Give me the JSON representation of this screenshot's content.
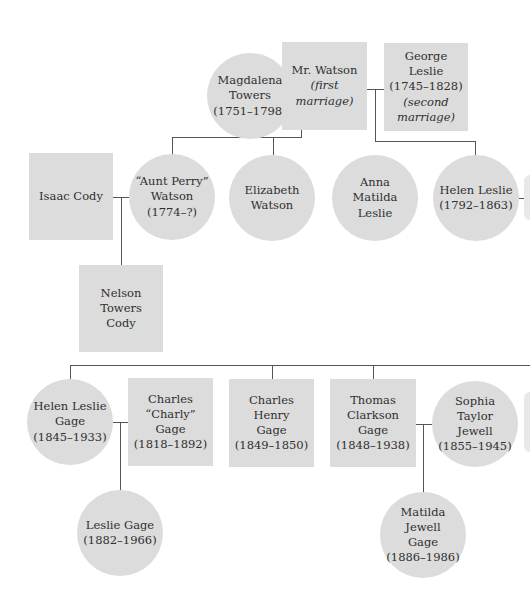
{
  "diagram": {
    "type": "family-tree",
    "colors": {
      "node_fill": "#dcdcdc",
      "text": "#2f2f2f",
      "line": "#555555"
    },
    "nodes": {
      "magdalena": {
        "shape": "circle",
        "name": "Magdalena Towers",
        "line1": "Magdalena",
        "line2": "Towers",
        "dates": "(1751–1798)"
      },
      "mr_watson": {
        "shape": "square",
        "name": "Mr. Watson",
        "line1": "Mr. Watson",
        "note": "(first marriage)"
      },
      "george_leslie": {
        "shape": "square",
        "name": "George Leslie",
        "line1": "George Leslie",
        "dates": "(1745–1828)",
        "note1": "(second",
        "note2": "marriage)"
      },
      "isaac_cody": {
        "shape": "square",
        "name": "Isaac Cody",
        "line1": "Isaac Cody"
      },
      "aunt_perry": {
        "shape": "circle",
        "name": "“Aunt Perry” Watson",
        "line1": "“Aunt Perry”",
        "line2": "Watson",
        "dates": "(1774–?)"
      },
      "elizabeth": {
        "shape": "circle",
        "name": "Elizabeth Watson",
        "line1": "Elizabeth",
        "line2": "Watson"
      },
      "anna_matilda": {
        "shape": "circle",
        "name": "Anna Matilda Leslie",
        "line1": "Anna Matilda",
        "line2": "Leslie"
      },
      "helen_leslie": {
        "shape": "circle",
        "name": "Helen Leslie",
        "line1": "Helen Leslie",
        "dates": "(1792–1863)"
      },
      "nelson": {
        "shape": "square",
        "name": "Nelson Towers Cody",
        "line1": "Nelson Towers",
        "line2": "Cody"
      },
      "helen_gage": {
        "shape": "circle",
        "name": "Helen Leslie Gage",
        "line1": "Helen Leslie",
        "line2": "Gage",
        "dates": "(1845–1933)"
      },
      "charly_gage": {
        "shape": "square",
        "name": "Charles “Charly” Gage",
        "line1": "Charles",
        "line2": "“Charly” Gage",
        "dates": "(1818–1892)"
      },
      "charles_henry": {
        "shape": "square",
        "name": "Charles Henry Gage",
        "line1": "Charles Henry",
        "line2": "Gage",
        "dates": "(1849–1850)"
      },
      "thomas": {
        "shape": "square",
        "name": "Thomas Clarkson Gage",
        "line1": "Thomas",
        "line2": "Clarkson Gage",
        "dates": "(1848–1938)"
      },
      "sophia": {
        "shape": "circle",
        "name": "Sophia Taylor Jewell",
        "line1": "Sophia Taylor",
        "line2": "Jewell",
        "dates": "(1855–1945)"
      },
      "leslie_gage": {
        "shape": "circle",
        "name": "Leslie Gage",
        "line1": "Leslie Gage",
        "dates": "(1882–1966)"
      },
      "matilda_gage": {
        "shape": "circle",
        "name": "Matilda Jewell Gage",
        "line1": "Matilda Jewell",
        "line2": "Gage",
        "dates": "(1886–1986)"
      }
    },
    "relationships": [
      {
        "type": "marriage",
        "a": "magdalena",
        "b": "mr_watson",
        "children": [
          "aunt_perry",
          "elizabeth"
        ]
      },
      {
        "type": "marriage",
        "a": "mr_watson",
        "b": "george_leslie",
        "children": [
          "anna_matilda",
          "helen_leslie"
        ]
      },
      {
        "type": "marriage",
        "a": "isaac_cody",
        "b": "aunt_perry",
        "children": [
          "nelson"
        ]
      },
      {
        "type": "marriage",
        "a": "helen_gage",
        "b": "charly_gage",
        "children": [
          "leslie_gage"
        ]
      },
      {
        "type": "marriage",
        "a": "thomas",
        "b": "sophia",
        "children": [
          "matilda_gage"
        ]
      },
      {
        "type": "siblings",
        "members": [
          "helen_gage",
          "charles_henry",
          "thomas"
        ]
      }
    ]
  }
}
